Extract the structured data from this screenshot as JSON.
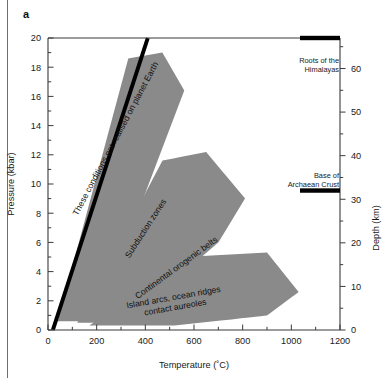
{
  "figure": {
    "panel_label": "a",
    "background_color": "#ffffff",
    "wedge_fill_color": "#8a8a8a",
    "line_color": "#000000"
  },
  "annotations": [
    {
      "name": "roots-of-the-himalayas",
      "line1": "Roots of the",
      "line2": "Himalayas",
      "depth_km": 67,
      "bar_side": "above"
    },
    {
      "name": "base-of-archaean-crust",
      "line1": "Base of",
      "line2": "Archaean Crust",
      "depth_km": 32,
      "bar_side": "below"
    }
  ],
  "chart_data": {
    "type": "area",
    "title": "",
    "subtitle": "",
    "xlabel": "Temperature (˚C)",
    "ylabel": "Pressure (kbar)",
    "y2label": "Depth (km)",
    "xlim": [
      0,
      1200
    ],
    "ylim": [
      0,
      20
    ],
    "y2lim": [
      0,
      67
    ],
    "grid": false,
    "legend_position": "inline-labels",
    "xticks": [
      0,
      200,
      400,
      600,
      800,
      1000,
      1200
    ],
    "xticklabels": [
      "0",
      "200",
      "400",
      "600",
      "800",
      "1000",
      "1200"
    ],
    "xminor_step": 100,
    "yticks": [
      0,
      2,
      4,
      6,
      8,
      10,
      12,
      14,
      16,
      18,
      20
    ],
    "yticklabels": [
      "0",
      "2",
      "4",
      "6",
      "8",
      "10",
      "12",
      "14",
      "16",
      "18",
      "20"
    ],
    "yminor_step": 1,
    "y2ticks": [
      0,
      10,
      20,
      30,
      40,
      50,
      60
    ],
    "y2ticklabels": [
      "0",
      "10",
      "20",
      "30",
      "40",
      "50",
      "60"
    ],
    "y2minor_step": 5,
    "forbidden_line": {
      "label": "These conditions not realised on planet Earth",
      "start": [
        20,
        0
      ],
      "end": [
        410,
        20
      ],
      "width_px": 4
    },
    "fields": [
      {
        "name": "subduction-zones",
        "label": "Subduction zones",
        "label_lines": [
          "Subduction zones"
        ],
        "polygon": [
          [
            40,
            0.6
          ],
          [
            330,
            18.6
          ],
          [
            470,
            19.0
          ],
          [
            560,
            16.4
          ],
          [
            300,
            5.0
          ],
          [
            140,
            0.6
          ]
        ]
      },
      {
        "name": "continental-orogenic-belts",
        "label": "Continental orogenic belts",
        "label_lines": [
          "Continental orogenic belts"
        ],
        "polygon": [
          [
            120,
            0.5
          ],
          [
            470,
            11.6
          ],
          [
            650,
            12.2
          ],
          [
            810,
            9.0
          ],
          [
            700,
            6.0
          ],
          [
            420,
            2.0
          ],
          [
            230,
            0.5
          ]
        ]
      },
      {
        "name": "island-arcs-ocean-ridges-contact-aureoles",
        "label": "Island arcs, ocean ridges contact aureoles",
        "label_lines": [
          "Island arcs, ocean ridges",
          "contact aureoles"
        ],
        "polygon": [
          [
            170,
            0.3
          ],
          [
            560,
            5.0
          ],
          [
            900,
            5.3
          ],
          [
            1030,
            2.6
          ],
          [
            900,
            1.0
          ],
          [
            520,
            0.3
          ]
        ]
      }
    ]
  }
}
